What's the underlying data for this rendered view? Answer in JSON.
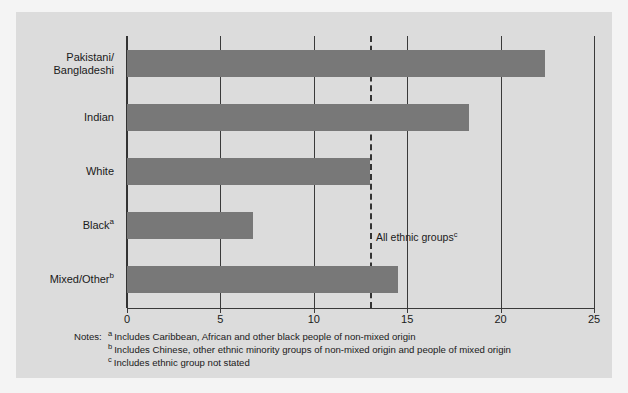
{
  "chart_data": {
    "type": "bar",
    "orientation": "horizontal",
    "title": "",
    "subtitle": "",
    "xlabel": "",
    "ylabel": "",
    "categories": [
      "Pakistani/ Bangladeshi",
      "Indian",
      "White",
      "Black",
      "Mixed/Other"
    ],
    "category_labels": [
      {
        "line1": "Pakistani/",
        "line2": "Bangladeshi",
        "sup": ""
      },
      {
        "line1": "Indian",
        "line2": "",
        "sup": ""
      },
      {
        "line1": "White",
        "line2": "",
        "sup": ""
      },
      {
        "line1": "Black",
        "line2": "",
        "sup": "a"
      },
      {
        "line1": "Mixed/Other",
        "line2": "",
        "sup": "b"
      }
    ],
    "values": [
      22.4,
      18.3,
      13.0,
      6.75,
      14.5
    ],
    "xlim": [
      0,
      25
    ],
    "xticks": [
      0,
      5,
      10,
      15,
      20,
      25
    ],
    "xtick_labels": [
      "0",
      "5",
      "10",
      "15",
      "20",
      "25"
    ],
    "grid": true,
    "gridlines_at": [
      0,
      5,
      10,
      15,
      20,
      25
    ],
    "legend": "none",
    "reference_line": {
      "value": 13.0,
      "style": "dashed",
      "label": "All ethnic groups",
      "label_sup": "c"
    },
    "bar_color": "#787878",
    "panel_color": "#dcdcdc",
    "axis_color": "#333333",
    "text_color": "#1a1a1a"
  },
  "notes": {
    "label": "Notes:",
    "items": [
      {
        "marker": "a",
        "text": "Includes Caribbean, African and other black people of non-mixed origin"
      },
      {
        "marker": "b",
        "text": "Includes Chinese, other ethnic minority groups of non-mixed origin and people of mixed origin"
      },
      {
        "marker": "c",
        "text": "Includes ethnic group not stated"
      }
    ]
  }
}
